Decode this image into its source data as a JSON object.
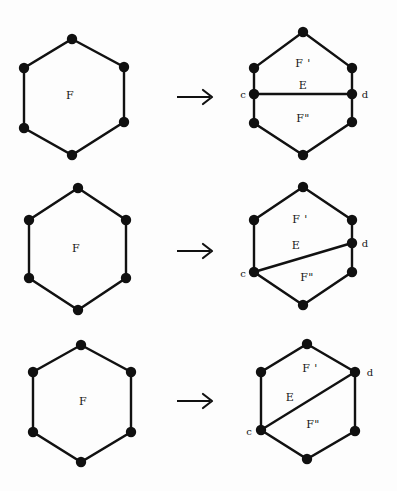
{
  "figure": {
    "background_color": "#fdfdfd",
    "ink_color": "#111111",
    "rows": [
      {
        "id": "row-1",
        "left": {
          "face_label": "F",
          "vertex_count": 6
        },
        "arrow": "→",
        "right": {
          "upper_face_label": "F '",
          "edge_label": "E",
          "lower_face_label": "F\"",
          "left_endpoint_label": "c",
          "right_endpoint_label": "d",
          "edge_orientation": "horizontal",
          "vertex_count": 8
        }
      },
      {
        "id": "row-2",
        "left": {
          "face_label": "F",
          "vertex_count": 6
        },
        "arrow": "→",
        "right": {
          "upper_face_label": "F '",
          "edge_label": "E",
          "lower_face_label": "F\"",
          "left_endpoint_label": "c",
          "right_endpoint_label": "d",
          "edge_orientation": "diagonal-shallow",
          "vertex_count": 7
        }
      },
      {
        "id": "row-3",
        "left": {
          "face_label": "F",
          "vertex_count": 6
        },
        "arrow": "→",
        "right": {
          "upper_face_label": "F '",
          "edge_label": "E",
          "lower_face_label": "F\"",
          "left_endpoint_label": "c",
          "right_endpoint_label": "d",
          "edge_orientation": "diagonal-steep",
          "vertex_count": 6
        }
      }
    ]
  }
}
